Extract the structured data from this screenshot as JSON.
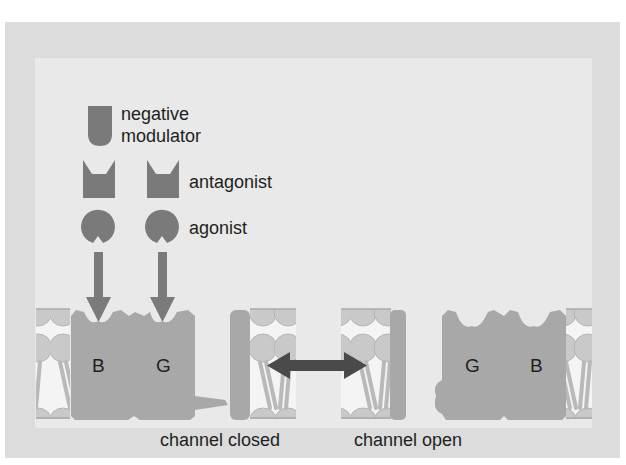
{
  "legend": {
    "negative_modulator": {
      "line1": "negative",
      "line2": "modulator",
      "icon": "negative-modulator-shape"
    },
    "antagonist": {
      "label": "antagonist",
      "icon": "antagonist-shape"
    },
    "agonist": {
      "label": "agonist",
      "icon": "agonist-shape"
    }
  },
  "receptors": {
    "closed": {
      "subunit_left": "B",
      "subunit_right": "G"
    },
    "open": {
      "subunit_left": "G",
      "subunit_right": "B"
    }
  },
  "states": {
    "closed": "channel closed",
    "open": "channel open"
  },
  "transition_icon": "double-headed-arrow",
  "colors": {
    "frame": "#dcdcdc",
    "panel": "#e9e9e9",
    "ligand": "#7a7a7a",
    "receptor": "#a8a8a8",
    "membrane_bg": "#f4f4f4",
    "lipid": "#c4c4c4",
    "double_arrow": "#4a4a4a"
  }
}
